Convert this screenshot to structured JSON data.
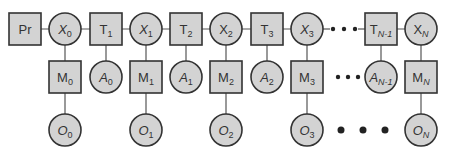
{
  "diagram": {
    "type": "chain graphical model",
    "colors": {
      "node_fill": "#d3d3d3",
      "node_stroke": "#333333",
      "edge": "#555555",
      "text": "#333333",
      "background": "#ffffff"
    },
    "top_row": [
      {
        "id": "Pr",
        "shape": "square",
        "base": "Pr",
        "sub": "",
        "italic": false,
        "cx": 25,
        "cy": 29
      },
      {
        "id": "X0",
        "shape": "circle",
        "base": "X",
        "sub": "0",
        "italic": true,
        "cx": 65,
        "cy": 29
      },
      {
        "id": "T1",
        "shape": "square",
        "base": "T",
        "sub": "1",
        "italic": false,
        "cx": 106,
        "cy": 29
      },
      {
        "id": "X1",
        "shape": "circle",
        "base": "X",
        "sub": "1",
        "italic": true,
        "cx": 146,
        "cy": 29
      },
      {
        "id": "T2",
        "shape": "square",
        "base": "T",
        "sub": "2",
        "italic": false,
        "cx": 186,
        "cy": 29
      },
      {
        "id": "X2",
        "shape": "circle",
        "base": "X",
        "sub": "2",
        "italic": false,
        "cx": 226,
        "cy": 29
      },
      {
        "id": "T3",
        "shape": "square",
        "base": "T",
        "sub": "3",
        "italic": false,
        "cx": 267,
        "cy": 29
      },
      {
        "id": "X3",
        "shape": "circle",
        "base": "X",
        "sub": "3",
        "italic": true,
        "cx": 307,
        "cy": 29
      },
      {
        "id": "TN-1",
        "shape": "square",
        "base": "T",
        "sub": "N-1",
        "italic": false,
        "cx": 381,
        "cy": 29
      },
      {
        "id": "XN",
        "shape": "circle",
        "base": "X",
        "sub": "N",
        "italic": false,
        "cx": 421,
        "cy": 29
      }
    ],
    "middle_row": [
      {
        "id": "M0",
        "shape": "square",
        "base": "M",
        "sub": "0",
        "italic": false,
        "cx": 65,
        "cy": 77
      },
      {
        "id": "A0",
        "shape": "circle",
        "base": "A",
        "sub": "0",
        "italic": true,
        "cx": 106,
        "cy": 77
      },
      {
        "id": "M1",
        "shape": "square",
        "base": "M",
        "sub": "1",
        "italic": false,
        "cx": 146,
        "cy": 77
      },
      {
        "id": "A1",
        "shape": "circle",
        "base": "A",
        "sub": "1",
        "italic": true,
        "cx": 186,
        "cy": 77
      },
      {
        "id": "M2",
        "shape": "square",
        "base": "M",
        "sub": "2",
        "italic": false,
        "cx": 226,
        "cy": 77
      },
      {
        "id": "A2",
        "shape": "circle",
        "base": "A",
        "sub": "2",
        "italic": true,
        "cx": 267,
        "cy": 77
      },
      {
        "id": "M3",
        "shape": "square",
        "base": "M",
        "sub": "3",
        "italic": false,
        "cx": 307,
        "cy": 77
      },
      {
        "id": "AN-1",
        "shape": "circle",
        "base": "A",
        "sub": "N-1",
        "italic": true,
        "cx": 381,
        "cy": 77
      },
      {
        "id": "MN",
        "shape": "square",
        "base": "M",
        "sub": "N",
        "italic": false,
        "cx": 421,
        "cy": 77
      }
    ],
    "bottom_row": [
      {
        "id": "O0",
        "shape": "circle",
        "base": "O",
        "sub": "0",
        "italic": true,
        "cx": 65,
        "cy": 130
      },
      {
        "id": "O1",
        "shape": "circle",
        "base": "O",
        "sub": "1",
        "italic": true,
        "cx": 146,
        "cy": 130
      },
      {
        "id": "O2",
        "shape": "circle",
        "base": "O",
        "sub": "2",
        "italic": true,
        "cx": 226,
        "cy": 130
      },
      {
        "id": "O3",
        "shape": "circle",
        "base": "O",
        "sub": "3",
        "italic": true,
        "cx": 307,
        "cy": 130
      },
      {
        "id": "ON",
        "shape": "circle",
        "base": "O",
        "sub": "N",
        "italic": true,
        "cx": 421,
        "cy": 130
      }
    ],
    "ellipses": [
      {
        "id": "top-ellipsis",
        "dots": [
          [
            333,
            29
          ],
          [
            344,
            29
          ],
          [
            355,
            29
          ]
        ],
        "r": 2.2
      },
      {
        "id": "middle-ellipsis",
        "dots": [
          [
            338,
            77
          ],
          [
            348,
            77
          ],
          [
            358,
            77
          ]
        ],
        "r": 2.2
      },
      {
        "id": "bottom-ellipsis",
        "dots": [
          [
            341,
            130
          ],
          [
            363,
            130
          ],
          [
            385,
            130
          ]
        ],
        "r": 3.5
      }
    ],
    "edges": [
      [
        "Pr",
        "X0"
      ],
      [
        "X0",
        "T1"
      ],
      [
        "T1",
        "X1"
      ],
      [
        "X1",
        "T2"
      ],
      [
        "T2",
        "X2"
      ],
      [
        "X2",
        "T3"
      ],
      [
        "T3",
        "X3"
      ],
      [
        "TN-1",
        "XN"
      ],
      [
        "X0",
        "M0"
      ],
      [
        "T1",
        "A0"
      ],
      [
        "X1",
        "M1"
      ],
      [
        "T2",
        "A1"
      ],
      [
        "X2",
        "M2"
      ],
      [
        "T3",
        "A2"
      ],
      [
        "X3",
        "M3"
      ],
      [
        "TN-1",
        "AN-1"
      ],
      [
        "XN",
        "MN"
      ],
      [
        "M0",
        "O0"
      ],
      [
        "M1",
        "O1"
      ],
      [
        "M2",
        "O2"
      ],
      [
        "M3",
        "O3"
      ],
      [
        "MN",
        "ON"
      ]
    ]
  }
}
